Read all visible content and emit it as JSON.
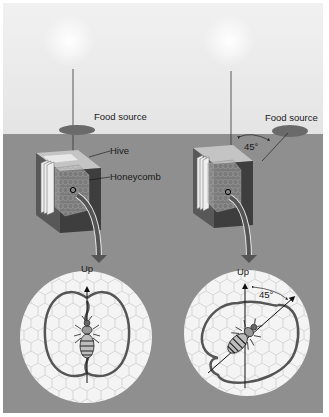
{
  "diagram": {
    "panels": [
      {
        "id": "left",
        "labels": {
          "food_source": "Food source",
          "hive": "Hive",
          "honeycomb": "Honeycomb",
          "up": "Up"
        },
        "food_angle_from_sun": "0°"
      },
      {
        "id": "right",
        "labels": {
          "food_source": "Food source",
          "angle_field": "45°",
          "up": "Up",
          "angle_dance": "45°"
        },
        "food_angle_from_sun": "45°"
      }
    ],
    "colors": {
      "sky": "#eaeaea",
      "ground": "#8f8f8f",
      "hive_top": "#c8c8c8",
      "hive_side": "#4a4a4a",
      "comb_circle": "#f4f4f4",
      "dance_path": "#555555",
      "arrow": "#555555"
    }
  }
}
